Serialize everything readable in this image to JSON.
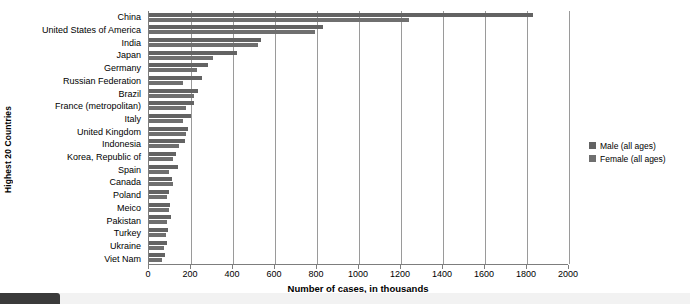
{
  "chart_data": {
    "type": "bar",
    "orientation": "horizontal",
    "title": "",
    "xlabel": "Number of cases, in thousands",
    "ylabel": "Highest 20 Countries",
    "xlim": [
      0,
      2000
    ],
    "xticks": [
      0,
      200,
      400,
      600,
      800,
      1000,
      1200,
      1400,
      1600,
      1800,
      2000
    ],
    "grid": true,
    "legend_position": "right",
    "categories": [
      "China",
      "United States of America",
      "India",
      "Japan",
      "Germany",
      "Russian Federation",
      "Brazil",
      "France (metropolitan)",
      "Italy",
      "United Kingdom",
      "Indonesia",
      "Korea, Republic of",
      "Spain",
      "Canada",
      "Poland",
      "Meico",
      "Pakistan",
      "Turkey",
      "Ukraine",
      "Viet Nam"
    ],
    "series": [
      {
        "name": "Male (all ages)",
        "color": "#636363",
        "values": [
          1830,
          830,
          535,
          420,
          280,
          250,
          235,
          215,
          200,
          185,
          170,
          130,
          140,
          110,
          95,
          100,
          105,
          90,
          85,
          75
        ]
      },
      {
        "name": "Female (all ages)",
        "color": "#6f6f6f",
        "values": [
          1240,
          790,
          520,
          305,
          230,
          160,
          215,
          175,
          160,
          175,
          145,
          115,
          95,
          115,
          85,
          95,
          85,
          80,
          70,
          60
        ]
      }
    ]
  },
  "legend": {
    "items": [
      {
        "label": "Male (all ages)"
      },
      {
        "label": "Female (all ages)"
      }
    ]
  }
}
